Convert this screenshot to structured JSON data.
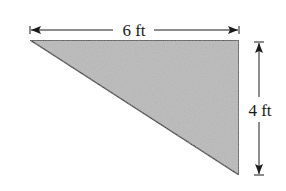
{
  "diagram": {
    "shape": "right-triangle",
    "fill_color": "#b3b3b3",
    "stroke_color": "#1a1a1a",
    "vertices": [
      [
        30,
        40
      ],
      [
        239,
        40
      ],
      [
        239,
        175
      ]
    ],
    "dimensions": {
      "width": {
        "label": "6 ft",
        "value": 6,
        "unit": "ft"
      },
      "height": {
        "label": "4 ft",
        "value": 4,
        "unit": "ft"
      }
    }
  }
}
